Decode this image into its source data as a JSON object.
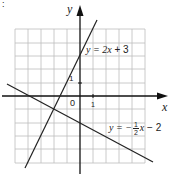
{
  "corner_mark": ":",
  "axes": {
    "x_label": "x",
    "y_label": "y",
    "origin_label": "0",
    "x_tick_label": "1",
    "y_tick_label": "1"
  },
  "grid": {
    "unit_px": 13.3,
    "origin_px": [
      80,
      96
    ],
    "x_range": [
      -5,
      5
    ],
    "y_range": [
      -5,
      5
    ],
    "line_color": "#bdbdbd",
    "axis_color": "#111111"
  },
  "lines": [
    {
      "name": "line-1",
      "equation": "y = 2x + 3",
      "label_prefix": "y = 2",
      "label_var": "x",
      "label_suffix": " + 3",
      "slope": 2,
      "intercept": 3
    },
    {
      "name": "line-2",
      "equation": "y = -1/2 x - 2",
      "label_prefix": "y = −",
      "frac_num": "1",
      "frac_den": "2",
      "label_var": "x",
      "label_suffix": " − 2",
      "slope": -0.5,
      "intercept": -2
    }
  ]
}
